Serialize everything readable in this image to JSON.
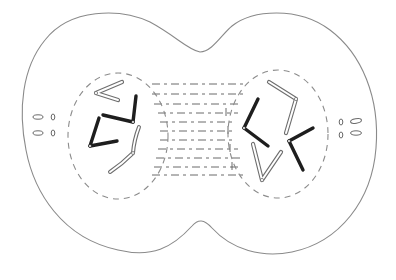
{
  "diagram": {
    "subject": "Animal cell in late anaphase / early telophase of mitosis",
    "colors": {
      "background": "#ffffff",
      "membrane": "#8a8a8a",
      "nuclear_envelope": "#8c8c8c",
      "spindle": "#5a5a5a",
      "chromosome_dark": "#1e1e1e",
      "chromosome_light_outline": "#6e6e6e",
      "chromosome_light_fill": "#ffffff",
      "centriole": "#6a6a6a"
    },
    "parts": [
      {
        "id": "cell-membrane",
        "label": "Cell membrane with cleavage furrow"
      },
      {
        "id": "nucleus-left",
        "label": "Left daughter nucleus (dashed envelope)"
      },
      {
        "id": "nucleus-right",
        "label": "Right daughter nucleus (dashed envelope)"
      },
      {
        "id": "spindle-fibers",
        "label": "Spindle fibers between nuclei"
      },
      {
        "id": "centrioles-left",
        "label": "Left centriole pairs"
      },
      {
        "id": "centrioles-right",
        "label": "Right centriole pairs"
      },
      {
        "id": "chromosomes-left",
        "label": "Left chromosome set (2 dark, 2 light)"
      },
      {
        "id": "chromosomes-right",
        "label": "Right chromosome set (2 dark, 2 light)"
      }
    ],
    "counts": {
      "chromosomes_per_nucleus": 4,
      "dark_chromosomes_per_nucleus": 2,
      "light_chromosomes_per_nucleus": 2,
      "centriole_pairs_per_pole": 2
    }
  }
}
